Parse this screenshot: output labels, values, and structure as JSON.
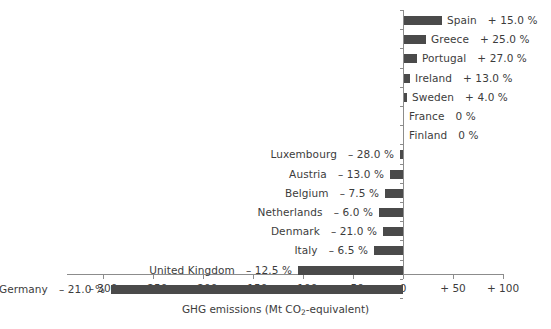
{
  "chart_data": {
    "type": "bar",
    "orientation": "horizontal",
    "title": "",
    "subtitle": "",
    "xlabel": "GHG emissions (Mt CO2-equivalent)",
    "xlabel_parts": {
      "pre": "GHG emissions (Mt CO",
      "sub": "2",
      "post": "-equivalent)"
    },
    "ylabel": "",
    "xlim": [
      -300,
      100
    ],
    "xticks": [
      -300,
      -250,
      -200,
      -150,
      -100,
      -50,
      0,
      50,
      100
    ],
    "xtick_labels": [
      "– 300",
      "– 250",
      "– 200",
      "– 150",
      "– 100",
      "– 50",
      "0",
      "+ 50",
      "+ 100"
    ],
    "grid": false,
    "legend": null,
    "bar_color": "#4a4a4a",
    "axis_color": "#8c8c8c",
    "text_color": "#3c3c3c",
    "categories": [
      "Spain",
      "Greece",
      "Portugal",
      "Ireland",
      "Sweden",
      "France",
      "Finland",
      "Luxembourg",
      "Austria",
      "Belgium",
      "Netherlands",
      "Denmark",
      "Italy",
      "United Kingdom",
      "Germany"
    ],
    "values": [
      38,
      22,
      13,
      6,
      3,
      0,
      0,
      -3,
      -13,
      -18,
      -24,
      -20,
      -29,
      -105,
      -292
    ],
    "percent_labels": [
      "+ 15.0 %",
      "+ 25.0 %",
      "+ 27.0 %",
      "+ 13.0 %",
      "+ 4.0 %",
      "0 %",
      "0 %",
      "– 28.0 %",
      "– 13.0 %",
      "– 7.5 %",
      "– 6.0 %",
      "– 21.0 %",
      "– 6.5 %",
      "– 12.5 %",
      "– 21.0 %"
    ],
    "percent_values": [
      15.0,
      25.0,
      27.0,
      13.0,
      4.0,
      0,
      0,
      -28.0,
      -13.0,
      -7.5,
      -6.0,
      -21.0,
      -6.5,
      -12.5,
      -21.0
    ]
  },
  "rows": [
    {
      "name": "Spain",
      "pct": "+ 15.0 %",
      "value": 38,
      "side": "right"
    },
    {
      "name": "Greece",
      "pct": "+ 25.0 %",
      "value": 22,
      "side": "right"
    },
    {
      "name": "Portugal",
      "pct": "+ 27.0 %",
      "value": 13,
      "side": "right"
    },
    {
      "name": "Ireland",
      "pct": "+ 13.0 %",
      "value": 6,
      "side": "right"
    },
    {
      "name": "Sweden",
      "pct": "+ 4.0 %",
      "value": 3,
      "side": "right"
    },
    {
      "name": "France",
      "pct": "0 %",
      "value": 0,
      "side": "right"
    },
    {
      "name": "Finland",
      "pct": "0 %",
      "value": 0,
      "side": "right"
    },
    {
      "name": "Luxembourg",
      "pct": "– 28.0 %",
      "value": -3,
      "side": "left"
    },
    {
      "name": "Austria",
      "pct": "– 13.0 %",
      "value": -13,
      "side": "left"
    },
    {
      "name": "Belgium",
      "pct": "– 7.5 %",
      "value": -18,
      "side": "left"
    },
    {
      "name": "Netherlands",
      "pct": "– 6.0 %",
      "value": -24,
      "side": "left"
    },
    {
      "name": "Denmark",
      "pct": "– 21.0 %",
      "value": -20,
      "side": "left"
    },
    {
      "name": "Italy",
      "pct": "– 6.5 %",
      "value": -29,
      "side": "left"
    },
    {
      "name": "United Kingdom",
      "pct": "– 12.5 %",
      "value": -105,
      "side": "left"
    },
    {
      "name": "Germany",
      "pct": "– 21.0 %",
      "value": -292,
      "side": "left"
    }
  ]
}
